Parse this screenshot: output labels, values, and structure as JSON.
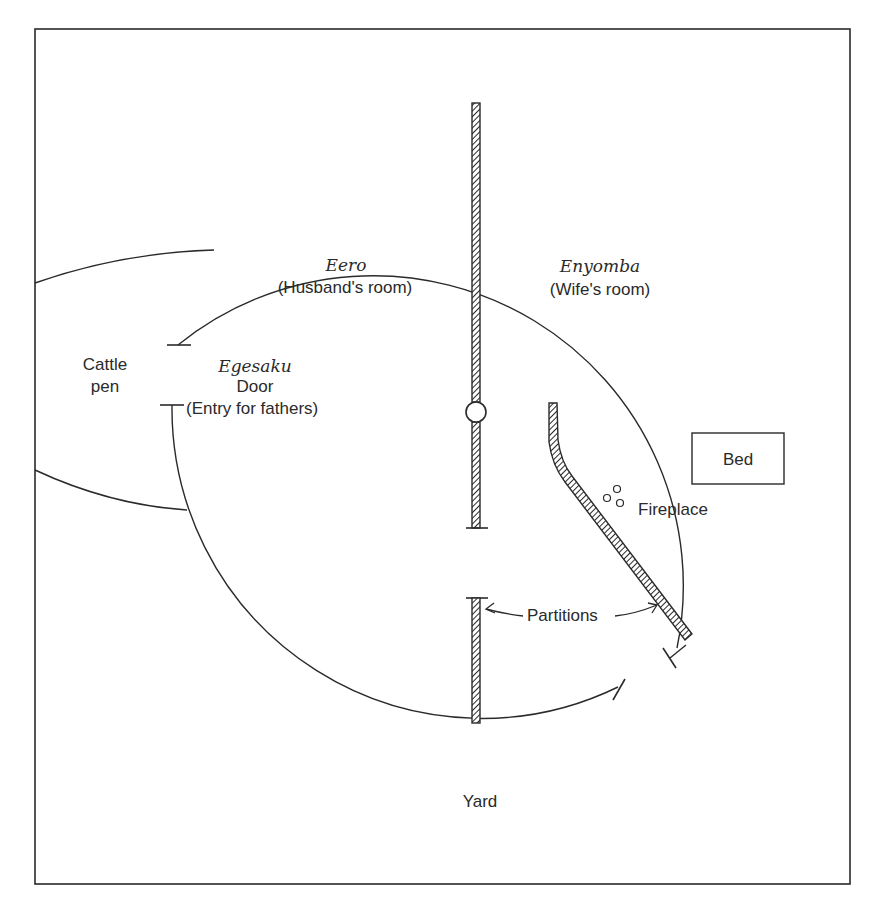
{
  "diagram": {
    "type": "floor-plan",
    "colors": {
      "ink": "#2a2a2a",
      "background": "#ffffff"
    },
    "rooms": [
      {
        "name": "Eero",
        "description": "(Husband's room)"
      },
      {
        "name": "Enyomba",
        "description": "(Wife's room)"
      }
    ],
    "door": {
      "name": "Egesaku",
      "label": "Door",
      "description": "(Entry for fathers)"
    },
    "cattle_pen": {
      "line1": "Cattle",
      "line2": "pen"
    },
    "bed": {
      "label": "Bed"
    },
    "fireplace": {
      "label": "Fireplace"
    },
    "partitions": {
      "label": "Partitions"
    },
    "yard": {
      "label": "Yard"
    }
  }
}
